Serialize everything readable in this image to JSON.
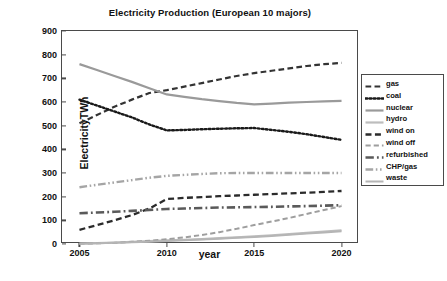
{
  "chart_data": {
    "type": "line",
    "title": "Electricity Production (European 10 majors)",
    "xlabel": "year",
    "ylabel": "ElectricityTWh",
    "x": [
      2005,
      2006,
      2007,
      2008,
      2009,
      2010,
      2011,
      2012,
      2013,
      2014,
      2015,
      2016,
      2017,
      2018,
      2019,
      2020
    ],
    "xlim": [
      2004,
      2021
    ],
    "ylim": [
      0,
      900
    ],
    "y_ticks": [
      0,
      100,
      200,
      300,
      400,
      500,
      600,
      700,
      800,
      900
    ],
    "x_ticks": [
      2005,
      2010,
      2015,
      2020
    ],
    "grid": false,
    "legend_position": "right",
    "series": [
      {
        "name": "gas",
        "color": "#333333",
        "style": "dashed",
        "width": 2.2,
        "values": [
          510,
          545,
          580,
          610,
          638,
          650,
          665,
          680,
          695,
          710,
          722,
          732,
          742,
          752,
          760,
          765
        ]
      },
      {
        "name": "coal",
        "color": "#1a1a1a",
        "style": "dotted",
        "width": 2.4,
        "values": [
          610,
          585,
          560,
          535,
          505,
          480,
          482,
          485,
          487,
          489,
          490,
          482,
          474,
          464,
          452,
          440
        ]
      },
      {
        "name": "nuclear",
        "color": "#9a9a9a",
        "style": "solid",
        "width": 2.2,
        "values": [
          760,
          735,
          710,
          685,
          658,
          632,
          622,
          612,
          604,
          596,
          590,
          593,
          597,
          600,
          603,
          605
        ]
      },
      {
        "name": "hydro",
        "color": "#bdbdbd",
        "style": "solid",
        "width": 2.2,
        "values": [
          2,
          4,
          6,
          9,
          12,
          15,
          18,
          21,
          25,
          28,
          32,
          37,
          42,
          47,
          52,
          58
        ]
      },
      {
        "name": "wind on",
        "color": "#2b2b2b",
        "style": "dashed",
        "width": 2.3,
        "values": [
          60,
          80,
          100,
          122,
          150,
          190,
          195,
          198,
          202,
          205,
          208,
          211,
          214,
          217,
          220,
          224
        ]
      },
      {
        "name": "wind off",
        "color": "#9e9e9e",
        "style": "dashed",
        "width": 2.0,
        "values": [
          1,
          3,
          5,
          9,
          14,
          20,
          28,
          38,
          50,
          64,
          80,
          95,
          110,
          127,
          144,
          160
        ]
      },
      {
        "name": "refurbished",
        "color": "#5a5a5a",
        "style": "dashdot",
        "width": 2.6,
        "values": [
          130,
          133,
          136,
          140,
          144,
          148,
          150,
          152,
          154,
          155,
          156,
          157,
          159,
          160,
          162,
          164
        ]
      },
      {
        "name": "CHP/gas",
        "color": "#a5a5a5",
        "style": "dashdotdot",
        "width": 2.4,
        "values": [
          240,
          250,
          260,
          270,
          280,
          288,
          292,
          296,
          299,
          300,
          300,
          300,
          300,
          300,
          300,
          300
        ]
      },
      {
        "name": "waste",
        "color": "#b5b5b5",
        "style": "solid",
        "width": 2.0,
        "values": [
          1,
          3,
          5,
          7,
          10,
          13,
          16,
          19,
          22,
          26,
          30,
          34,
          39,
          44,
          49,
          54
        ]
      }
    ]
  },
  "axes": {
    "y_tick_labels": [
      "900",
      "800",
      "700",
      "600",
      "500",
      "400",
      "300",
      "200",
      "100",
      "0"
    ],
    "x_tick_labels": [
      "2005",
      "2010",
      "2015",
      "2020"
    ]
  }
}
